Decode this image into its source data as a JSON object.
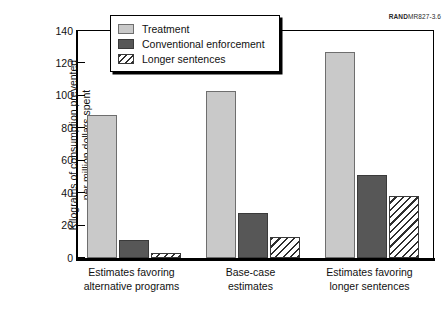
{
  "figure_id": {
    "brand": "RAND",
    "code": "MR827-3.6"
  },
  "chart_data": {
    "type": "bar",
    "title": "",
    "xlabel": "",
    "ylabel": "Kilograms of consumption prevented\nper million dollars spent",
    "ylim": [
      0,
      140
    ],
    "yticks": [
      0,
      20,
      40,
      60,
      80,
      100,
      120,
      140
    ],
    "grid": false,
    "legend_position": "top-center",
    "categories": [
      "Estimates favoring\nalternative programs",
      "Base-case\nestimates",
      "Estimates favoring\nlonger sentences"
    ],
    "series": [
      {
        "name": "Treatment",
        "color": "#c9c9c9",
        "pattern": "solid",
        "values": [
          88,
          103,
          127
        ]
      },
      {
        "name": "Conventional enforcement",
        "color": "#575757",
        "pattern": "solid",
        "values": [
          11,
          28,
          51
        ]
      },
      {
        "name": "Longer sentences",
        "color": "#ffffff",
        "pattern": "diagonal-hatch",
        "values": [
          3,
          13,
          38
        ]
      }
    ]
  }
}
